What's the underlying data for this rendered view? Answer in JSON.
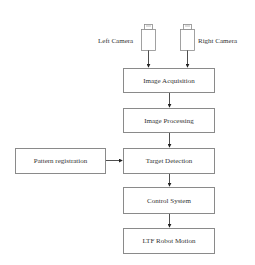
{
  "diagram": {
    "type": "flowchart",
    "cameras": {
      "left": {
        "label": "Left Camera"
      },
      "right": {
        "label": "Right Camera"
      }
    },
    "nodes": [
      {
        "id": "acq",
        "label": "Image Acquisition"
      },
      {
        "id": "proc",
        "label": "Image Processing"
      },
      {
        "id": "det",
        "label": "Target Detection"
      },
      {
        "id": "ctrl",
        "label": "Control System"
      },
      {
        "id": "motion",
        "label": "LTF Robot Motion"
      },
      {
        "id": "pattern",
        "label": "Pattern registration"
      }
    ],
    "edges": [
      {
        "from": "Left Camera",
        "to": "Image Acquisition"
      },
      {
        "from": "Right Camera",
        "to": "Image Acquisition"
      },
      {
        "from": "Image Acquisition",
        "to": "Image Processing"
      },
      {
        "from": "Image Processing",
        "to": "Target Detection"
      },
      {
        "from": "Pattern registration",
        "to": "Target Detection"
      },
      {
        "from": "Target Detection",
        "to": "Control System"
      },
      {
        "from": "Control System",
        "to": "LTF Robot Motion"
      }
    ],
    "colors": {
      "stroke": "#8a8a8a",
      "arrow": "#222222",
      "text": "#333333"
    }
  }
}
